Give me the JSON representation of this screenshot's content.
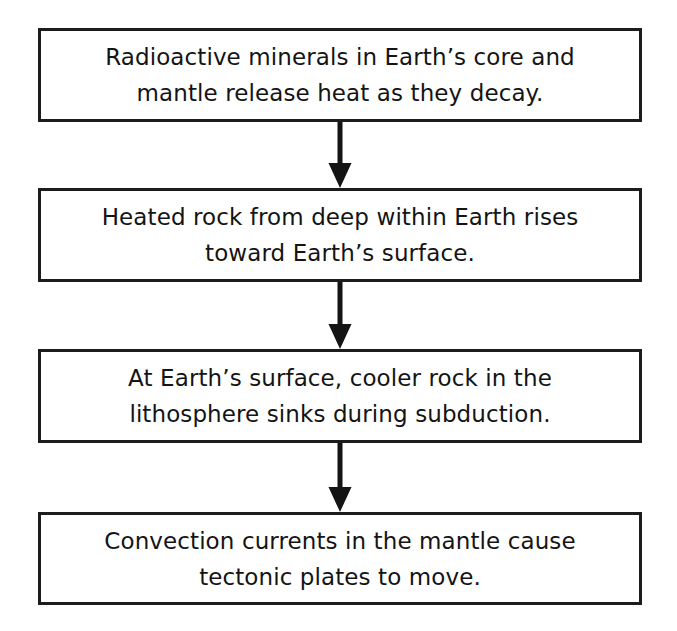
{
  "diagram": {
    "type": "flowchart",
    "orientation": "vertical",
    "title": "",
    "canvas": {
      "width": 677,
      "height": 631,
      "background": "#ffffff"
    },
    "style": {
      "box_fill": "#ffffff",
      "box_border_color": "#1c1c1c",
      "box_border_width_px": 3,
      "text_color": "#141414",
      "arrow_color": "#141414"
    },
    "steps": [
      {
        "id": "step-1",
        "order": 1,
        "text": "Radioactive minerals in Earth’s core and\nmantle release heat as they decay.",
        "line_1": "Radioactive minerals in Earth’s core and",
        "line_2": "mantle release heat as they decay."
      },
      {
        "id": "step-2",
        "order": 2,
        "text": "Heated rock from deep within Earth rises\ntoward Earth’s surface.",
        "line_1": "Heated rock from deep within Earth rises",
        "line_2": "toward Earth’s surface."
      },
      {
        "id": "step-3",
        "order": 3,
        "text": "At Earth’s surface, cooler rock in the\nlithosphere sinks during subduction.",
        "line_1": "At Earth’s surface, cooler rock in the",
        "line_2": "lithosphere sinks during subduction."
      },
      {
        "id": "step-4",
        "order": 4,
        "text": "Convection currents in the mantle cause\ntectonic plates to move.",
        "line_1": "Convection currents in the mantle cause",
        "line_2": "tectonic plates to move."
      }
    ],
    "connectors": [
      {
        "id": "connector-1",
        "from": "step-1",
        "to": "step-2",
        "icon": "down-arrow-icon",
        "label": ""
      },
      {
        "id": "connector-2",
        "from": "step-2",
        "to": "step-3",
        "icon": "down-arrow-icon",
        "label": ""
      },
      {
        "id": "connector-3",
        "from": "step-3",
        "to": "step-4",
        "icon": "down-arrow-icon",
        "label": ""
      }
    ]
  }
}
